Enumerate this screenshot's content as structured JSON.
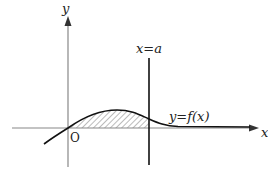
{
  "diagram": {
    "type": "function-graph-with-shaded-area",
    "axes": {
      "x_label": "x",
      "y_label": "y",
      "origin_label": "O"
    },
    "vertical_line": {
      "label": "x=a"
    },
    "curve": {
      "label": "y=f(x)"
    },
    "shaded_region": "area between y=f(x) and x-axis from 0 to a",
    "colors": {
      "axis": "#888888",
      "curve": "#111111",
      "line": "#111111",
      "hatch": "#777777"
    }
  }
}
